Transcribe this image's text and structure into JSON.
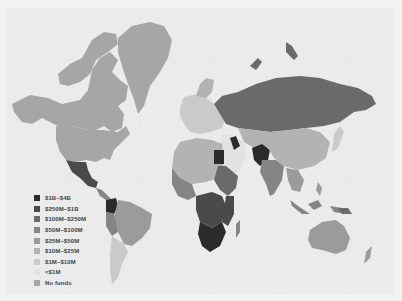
{
  "map": {
    "type": "choropleth world map",
    "projection": "Mercator",
    "background_color": "#ebebeb",
    "legend": {
      "items": [
        {
          "label": "$1B–$4B",
          "color": "#2b2b2b"
        },
        {
          "label": "$250M–$1B",
          "color": "#4a4a4a"
        },
        {
          "label": "$100M–$250M",
          "color": "#6a6a6a"
        },
        {
          "label": "$50M–$100M",
          "color": "#858585"
        },
        {
          "label": "$25M–$50M",
          "color": "#9b9b9b"
        },
        {
          "label": "$10M–$25M",
          "color": "#b3b3b3"
        },
        {
          "label": "$1M–$10M",
          "color": "#cacaca"
        },
        {
          "label": "<$1M",
          "color": "#e2e2e2"
        },
        {
          "label": "No funds",
          "color": "#a6a6a6"
        }
      ]
    }
  }
}
